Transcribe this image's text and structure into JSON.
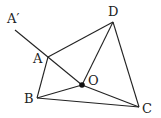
{
  "diagram": {
    "labels": {
      "a_prime": "A′",
      "a": "A",
      "b": "B",
      "c": "C",
      "d": "D",
      "o": "O"
    },
    "points": {
      "A_prime": [
        15,
        30
      ],
      "A": [
        48,
        57
      ],
      "B": [
        37,
        98
      ],
      "C": [
        139,
        107
      ],
      "D": [
        113,
        22
      ],
      "O": [
        82,
        85
      ]
    },
    "segments": [
      [
        "A_prime",
        "O"
      ],
      [
        "A",
        "D"
      ],
      [
        "A",
        "B"
      ],
      [
        "B",
        "C"
      ],
      [
        "B",
        "O"
      ],
      [
        "O",
        "D"
      ],
      [
        "O",
        "C"
      ],
      [
        "D",
        "C"
      ]
    ],
    "stroke_color": "#222222"
  }
}
